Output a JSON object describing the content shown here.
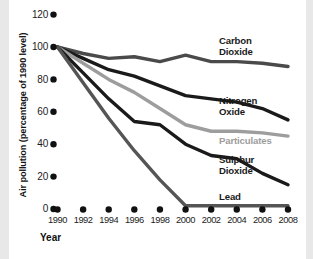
{
  "chart_data": {
    "type": "line",
    "title": "",
    "xlabel": "Year",
    "ylabel": "Air pollution (percentage of 1990 level)",
    "x": [
      1990,
      1992,
      1994,
      1996,
      1998,
      2000,
      2002,
      2004,
      2006,
      2008
    ],
    "xtick_labels": [
      "1990",
      "1992",
      "1994",
      "1996",
      "1998",
      "2000",
      "2002",
      "2004",
      "2006",
      "2008"
    ],
    "ytick_labels": [
      "0",
      "20",
      "40",
      "60",
      "80",
      "100",
      "120"
    ],
    "yticks": [
      0,
      20,
      40,
      60,
      80,
      100,
      120
    ],
    "xlim": [
      1990,
      2008
    ],
    "ylim": [
      0,
      120
    ],
    "grid": false,
    "legend": "inline-labels-right",
    "series": [
      {
        "name": "Carbon Dioxide",
        "label": "Carbon\nDioxide",
        "color": "#4a4a4a",
        "values": [
          100,
          96,
          93,
          94,
          91,
          95,
          91,
          91,
          90,
          88
        ]
      },
      {
        "name": "Nitrogen Oxide",
        "label": "Nitrogen\nOxide",
        "color": "#1a1a1a",
        "values": [
          100,
          93,
          86,
          82,
          76,
          70,
          68,
          66,
          62,
          55
        ]
      },
      {
        "name": "Particulates",
        "label": "Particulates",
        "color": "#9d9d9d",
        "values": [
          100,
          90,
          80,
          72,
          62,
          52,
          48,
          48,
          47,
          45
        ]
      },
      {
        "name": "Sulphur Dioxide",
        "label": "Sulphur\nDioxide",
        "color": "#1a1a1a",
        "values": [
          100,
          84,
          68,
          54,
          52,
          40,
          33,
          31,
          22,
          15
        ]
      },
      {
        "name": "Lead",
        "label": "Lead",
        "color": "#555555",
        "values": [
          100,
          78,
          56,
          36,
          18,
          2,
          2,
          2,
          2,
          2
        ]
      }
    ]
  },
  "axis": {
    "y_title": "Air pollution (percentage of 1990 level)",
    "x_title": "Year"
  },
  "caption": {
    "text": ""
  }
}
